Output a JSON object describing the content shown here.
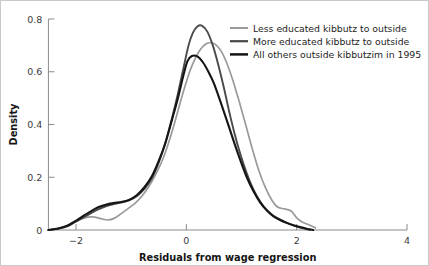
{
  "chart_data": {
    "type": "line",
    "title": "",
    "xlabel": "Residuals from wage regression",
    "ylabel": "Density",
    "xlim": [
      -2.5,
      4.0
    ],
    "ylim": [
      0,
      0.8
    ],
    "xticks": [
      -2,
      0,
      2,
      4
    ],
    "xtick_labels": [
      "−2",
      "0",
      "2",
      "4"
    ],
    "yticks": [
      0,
      0.2,
      0.4,
      0.6,
      0.8
    ],
    "ytick_labels": [
      "0",
      "0.2",
      "0.4",
      "0.6",
      "0.8"
    ],
    "grid": false,
    "legend_position": "top-right",
    "series": [
      {
        "name": "Less educated kibbutz to outside",
        "color": "#9a9a9a",
        "width": 1.7,
        "x": [
          -2.5,
          -2.3,
          -2.15,
          -2.0,
          -1.85,
          -1.7,
          -1.55,
          -1.42,
          -1.3,
          -1.18,
          -1.05,
          -0.92,
          -0.8,
          -0.68,
          -0.55,
          -0.42,
          -0.3,
          -0.18,
          -0.06,
          0.06,
          0.16,
          0.26,
          0.36,
          0.44,
          0.52,
          0.62,
          0.72,
          0.84,
          0.96,
          1.08,
          1.2,
          1.32,
          1.44,
          1.56,
          1.66,
          1.78,
          1.9,
          2.0,
          2.1,
          2.22,
          2.34
        ],
        "y": [
          0.0,
          0.006,
          0.016,
          0.032,
          0.046,
          0.05,
          0.043,
          0.038,
          0.045,
          0.062,
          0.082,
          0.103,
          0.13,
          0.165,
          0.213,
          0.272,
          0.345,
          0.43,
          0.52,
          0.6,
          0.65,
          0.686,
          0.706,
          0.71,
          0.705,
          0.682,
          0.64,
          0.57,
          0.486,
          0.396,
          0.305,
          0.222,
          0.158,
          0.11,
          0.086,
          0.08,
          0.072,
          0.046,
          0.03,
          0.02,
          0.008
        ]
      },
      {
        "name": "More educated kibbutz to outside",
        "color": "#4a4a4a",
        "width": 1.9,
        "x": [
          -2.5,
          -2.32,
          -2.16,
          -2.02,
          -1.88,
          -1.74,
          -1.6,
          -1.46,
          -1.32,
          -1.18,
          -1.04,
          -0.9,
          -0.76,
          -0.62,
          -0.5,
          -0.38,
          -0.26,
          -0.16,
          -0.06,
          0.04,
          0.12,
          0.2,
          0.28,
          0.38,
          0.48,
          0.58,
          0.68,
          0.8,
          0.92,
          1.04,
          1.16,
          1.28,
          1.4,
          1.52,
          1.64,
          1.76,
          1.88,
          2.0,
          2.12,
          2.24
        ],
        "y": [
          0.0,
          0.005,
          0.014,
          0.03,
          0.046,
          0.062,
          0.078,
          0.09,
          0.098,
          0.104,
          0.112,
          0.128,
          0.156,
          0.198,
          0.256,
          0.33,
          0.424,
          0.51,
          0.606,
          0.7,
          0.748,
          0.772,
          0.775,
          0.752,
          0.7,
          0.626,
          0.54,
          0.428,
          0.33,
          0.248,
          0.18,
          0.128,
          0.09,
          0.064,
          0.046,
          0.033,
          0.022,
          0.013,
          0.006,
          0.001
        ]
      },
      {
        "name": "All others outside kibbutzim in 1995",
        "color": "#151515",
        "width": 2.1,
        "x": [
          -2.5,
          -2.32,
          -2.16,
          -2.02,
          -1.88,
          -1.74,
          -1.6,
          -1.46,
          -1.32,
          -1.18,
          -1.04,
          -0.9,
          -0.76,
          -0.62,
          -0.5,
          -0.38,
          -0.26,
          -0.16,
          -0.06,
          0.02,
          0.1,
          0.2,
          0.3,
          0.4,
          0.5,
          0.62,
          0.74,
          0.86,
          0.98,
          1.1,
          1.22,
          1.34,
          1.46,
          1.58,
          1.7,
          1.82,
          1.94,
          2.06,
          2.18,
          2.3
        ],
        "y": [
          0.0,
          0.006,
          0.016,
          0.033,
          0.052,
          0.07,
          0.086,
          0.096,
          0.102,
          0.106,
          0.114,
          0.132,
          0.162,
          0.206,
          0.262,
          0.33,
          0.418,
          0.494,
          0.58,
          0.64,
          0.66,
          0.658,
          0.636,
          0.6,
          0.556,
          0.486,
          0.412,
          0.336,
          0.264,
          0.198,
          0.146,
          0.104,
          0.074,
          0.052,
          0.038,
          0.027,
          0.018,
          0.011,
          0.005,
          0.0
        ]
      }
    ]
  },
  "axes": {
    "y_title": "Density",
    "x_title": "Residuals from wage regression"
  },
  "legend": {
    "entries": [
      {
        "label": "Less educated kibbutz to outside",
        "color": "#9a9a9a"
      },
      {
        "label": "More educated kibbutz to outside",
        "color": "#4a4a4a"
      },
      {
        "label": "All others outside kibbutzim in 1995",
        "color": "#151515"
      }
    ]
  },
  "colors": {
    "axis": "#8a8a8a",
    "frame": "#c9c9c9",
    "text": "#151515"
  }
}
